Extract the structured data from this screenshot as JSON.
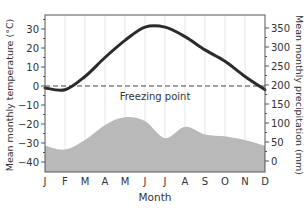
{
  "chart_data": {
    "type": "climate-graph",
    "title": "",
    "xlabel": "Month",
    "categories": [
      "J",
      "F",
      "M",
      "A",
      "M",
      "J",
      "J",
      "A",
      "S",
      "O",
      "N",
      "D"
    ],
    "ylabel_left": "Mean monthly temperature (°C)",
    "ylabel_right": "Mean monthly precipitation (mm)",
    "ylim_left": [
      -45,
      37
    ],
    "ylim_right": [
      0,
      370
    ],
    "yticks_left": [
      30,
      20,
      10,
      0,
      -10,
      -20,
      -30,
      -40
    ],
    "yticks_right": [
      350,
      300,
      250,
      200,
      150,
      100,
      50,
      0
    ],
    "grid": "vertical",
    "series": [
      {
        "name": "Mean monthly temperature",
        "type": "line",
        "axis": "left",
        "color": "#2b2b2b",
        "values": [
          -1,
          -2,
          5,
          15,
          24,
          31,
          31,
          26,
          19,
          13,
          5,
          -2
        ]
      },
      {
        "name": "Mean monthly precipitation",
        "type": "area",
        "axis": "right",
        "color": "#b8b8b8",
        "values": [
          40,
          30,
          55,
          95,
          115,
          105,
          60,
          90,
          70,
          65,
          55,
          40
        ]
      }
    ],
    "annotations": [
      {
        "text": "Freezing point",
        "type": "dashed-hline",
        "y_left": 0
      }
    ]
  },
  "labels": {
    "freezing": "Freezing point",
    "xlabel": "Month",
    "ylabel_left": "Mean monthly temperature (°C)",
    "ylabel_right": "Mean monthly precipitation (mm)"
  }
}
